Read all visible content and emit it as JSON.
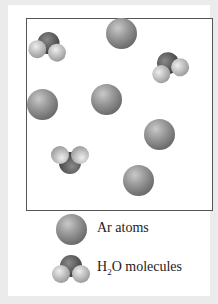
{
  "figure": {
    "container": {
      "ar_atoms": [
        {
          "x": 121,
          "y": 33
        },
        {
          "x": 42,
          "y": 104
        },
        {
          "x": 106,
          "y": 99
        },
        {
          "x": 159,
          "y": 134
        },
        {
          "x": 138,
          "y": 180
        }
      ],
      "h2o_molecules": [
        {
          "x": 48,
          "y": 46,
          "rotation": 10
        },
        {
          "x": 169,
          "y": 66,
          "rotation": -20
        },
        {
          "x": 70,
          "y": 160,
          "rotation": 180
        }
      ]
    },
    "legend": {
      "ar_label": "Ar atoms",
      "h2o_label_prefix": "H",
      "h2o_label_sub": "2",
      "h2o_label_suffix": "O molecules"
    },
    "colors": {
      "background": "#ebebeb",
      "panel": "#ffffff",
      "border": "#555555",
      "argon": "#8a8a8a",
      "oxygen": "#5a5a5a",
      "hydrogen": "#c8c8c8"
    }
  }
}
